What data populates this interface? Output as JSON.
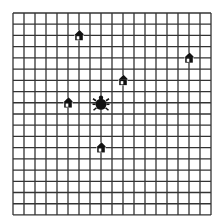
{
  "grid": {
    "columns": 18,
    "rows": 18,
    "origin_x": 13,
    "origin_y": 13,
    "cell_w": 11,
    "cell_h": 11.22,
    "line_color": "#333333",
    "background": "#ffffff"
  },
  "bug": {
    "icon": "beetle-icon",
    "grid_x": 8,
    "grid_y": 8,
    "color": "#111111"
  },
  "houses": [
    {
      "icon": "house-icon",
      "grid_x": 6,
      "grid_y": 2
    },
    {
      "icon": "house-icon",
      "grid_x": 16,
      "grid_y": 4
    },
    {
      "icon": "house-icon",
      "grid_x": 10,
      "grid_y": 6
    },
    {
      "icon": "house-icon",
      "grid_x": 5,
      "grid_y": 8
    },
    {
      "icon": "house-icon",
      "grid_x": 8,
      "grid_y": 12
    }
  ]
}
